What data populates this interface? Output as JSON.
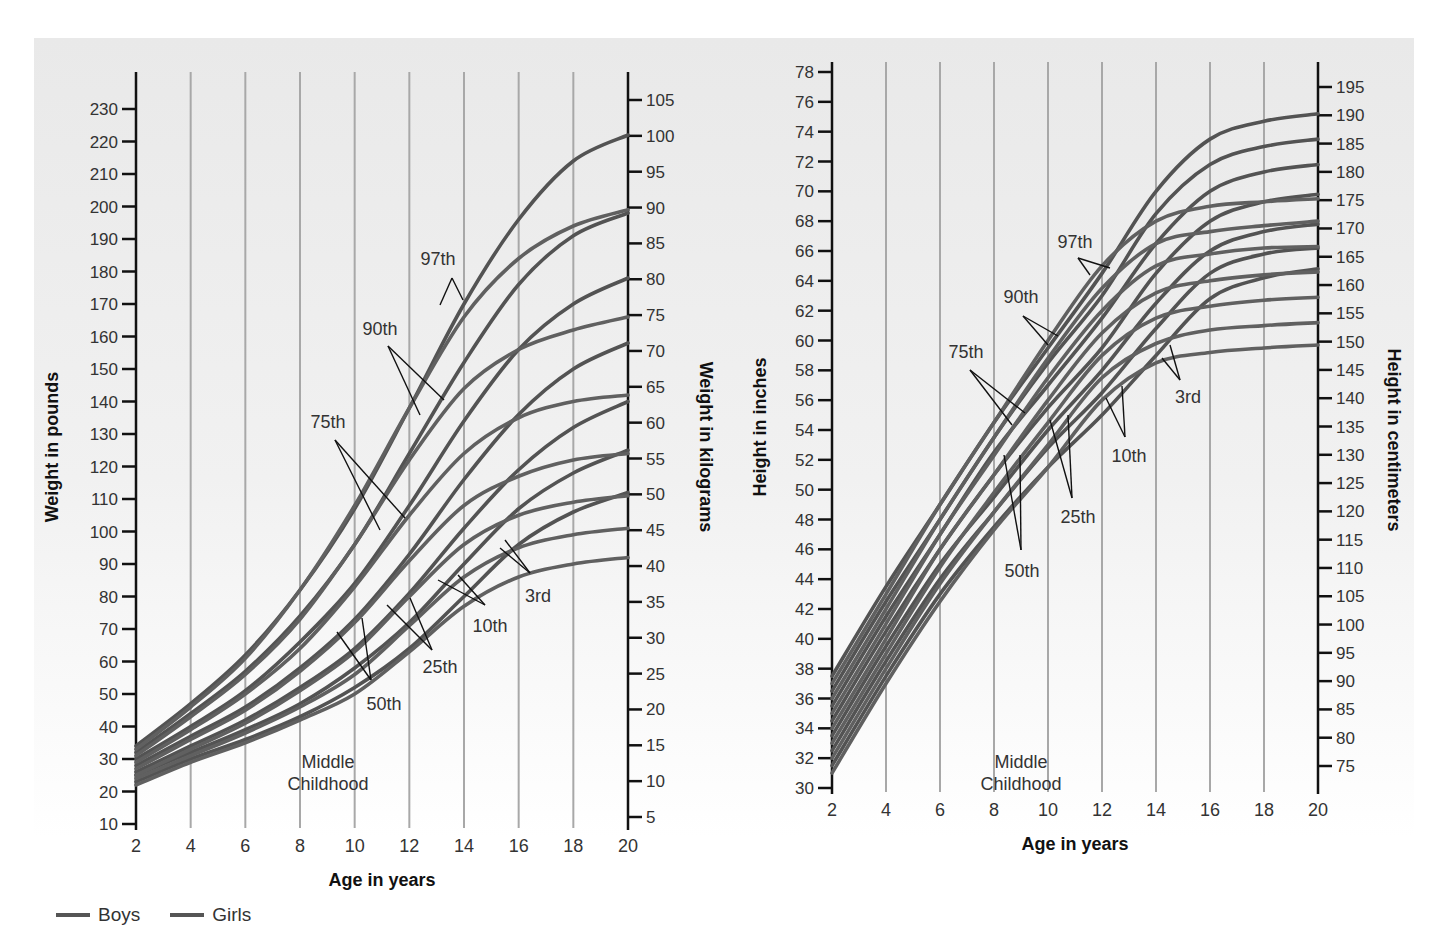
{
  "page": {
    "number_fragment": "391"
  },
  "legend": [
    {
      "label": "Boys",
      "color": "#5a5a5a"
    },
    {
      "label": "Girls",
      "color": "#6a6a6a"
    }
  ],
  "colors": {
    "panel_bg": "#ececec",
    "grid": "#a8a8a8",
    "axis": "#111111",
    "curve": "#555555",
    "text": "#333333"
  },
  "chart_data": [
    {
      "type": "line",
      "title": "Weight",
      "xlabel": "Age in years",
      "ylabel": "Weight in pounds",
      "ylabel_right": "Weight in kilograms",
      "x_ticks": [
        2,
        4,
        6,
        8,
        10,
        12,
        14,
        16,
        18,
        20
      ],
      "y_ticks": [
        10,
        20,
        30,
        40,
        50,
        60,
        70,
        80,
        90,
        100,
        110,
        120,
        130,
        140,
        150,
        160,
        170,
        180,
        190,
        200,
        210,
        220,
        230
      ],
      "y2_ticks": [
        5,
        10,
        15,
        20,
        25,
        30,
        35,
        40,
        45,
        50,
        55,
        60,
        65,
        70,
        75,
        80,
        85,
        90,
        95,
        100,
        105
      ],
      "xlim": [
        2,
        20
      ],
      "ylim": [
        10,
        230
      ],
      "y2lim": [
        5,
        105
      ],
      "annotation": "Middle Childhood",
      "percentile_labels": [
        "97th",
        "90th",
        "75th",
        "50th",
        "25th",
        "10th",
        "3rd"
      ],
      "x": [
        2,
        4,
        6,
        8,
        10,
        12,
        14,
        16,
        18,
        20
      ],
      "series": [
        {
          "name": "Boys 97th",
          "group": "Boys",
          "values": [
            34,
            47,
            62,
            82,
            107,
            138,
            170,
            196,
            214,
            222
          ]
        },
        {
          "name": "Boys 90th",
          "group": "Boys",
          "values": [
            32,
            44,
            57,
            74,
            96,
            124,
            152,
            176,
            191,
            198
          ]
        },
        {
          "name": "Boys 75th",
          "group": "Boys",
          "values": [
            30,
            40,
            51,
            66,
            84,
            108,
            134,
            156,
            170,
            178
          ]
        },
        {
          "name": "Boys 50th",
          "group": "Boys",
          "values": [
            28,
            37,
            46,
            58,
            73,
            93,
            116,
            136,
            150,
            158
          ]
        },
        {
          "name": "Boys 25th",
          "group": "Boys",
          "values": [
            26,
            34,
            42,
            52,
            64,
            81,
            101,
            119,
            132,
            140
          ]
        },
        {
          "name": "Boys 10th",
          "group": "Boys",
          "values": [
            25,
            32,
            39,
            47,
            58,
            72,
            90,
            107,
            118,
            125
          ]
        },
        {
          "name": "Boys 3rd",
          "group": "Boys",
          "values": [
            23,
            30,
            36,
            43,
            52,
            64,
            80,
            96,
            106,
            112
          ]
        },
        {
          "name": "Girls 97th",
          "group": "Girls",
          "values": [
            33,
            46,
            61,
            82,
            108,
            138,
            166,
            184,
            194,
            199
          ]
        },
        {
          "name": "Girls 90th",
          "group": "Girls",
          "values": [
            31,
            43,
            56,
            73,
            96,
            122,
            144,
            156,
            162,
            166
          ]
        },
        {
          "name": "Girls 75th",
          "group": "Girls",
          "values": [
            29,
            39,
            50,
            64,
            83,
            105,
            124,
            135,
            140,
            142
          ]
        },
        {
          "name": "Girls 50th",
          "group": "Girls",
          "values": [
            27,
            36,
            45,
            57,
            72,
            91,
            108,
            117,
            122,
            124
          ]
        },
        {
          "name": "Girls 25th",
          "group": "Girls",
          "values": [
            25,
            33,
            41,
            51,
            63,
            80,
            96,
            105,
            109,
            111
          ]
        },
        {
          "name": "Girls 10th",
          "group": "Girls",
          "values": [
            24,
            31,
            38,
            46,
            56,
            71,
            86,
            95,
            99,
            101
          ]
        },
        {
          "name": "Girls 3rd",
          "group": "Girls",
          "values": [
            22,
            29,
            35,
            42,
            50,
            63,
            77,
            86,
            90,
            92
          ]
        }
      ]
    },
    {
      "type": "line",
      "title": "Height",
      "xlabel": "Age in years",
      "ylabel": "Height in inches",
      "ylabel_right": "Height in centimeters",
      "x_ticks": [
        2,
        4,
        6,
        8,
        10,
        12,
        14,
        16,
        18,
        20
      ],
      "y_ticks": [
        30,
        32,
        34,
        36,
        38,
        40,
        42,
        44,
        46,
        48,
        50,
        52,
        54,
        56,
        58,
        60,
        62,
        64,
        66,
        68,
        70,
        72,
        74,
        76,
        78
      ],
      "y2_ticks": [
        75,
        80,
        85,
        90,
        95,
        100,
        105,
        110,
        115,
        120,
        125,
        130,
        135,
        140,
        145,
        150,
        155,
        160,
        165,
        170,
        175,
        180,
        185,
        190,
        195
      ],
      "xlim": [
        2,
        20
      ],
      "ylim": [
        30,
        78
      ],
      "y2lim": [
        75,
        195
      ],
      "annotation": "Middle Childhood",
      "percentile_labels": [
        "97th",
        "90th",
        "75th",
        "50th",
        "25th",
        "10th",
        "3rd"
      ],
      "x": [
        2,
        4,
        6,
        8,
        10,
        12,
        14,
        16,
        18,
        20
      ],
      "series": [
        {
          "name": "Boys 97th",
          "group": "Boys",
          "values": [
            37.5,
            43.5,
            49,
            54.5,
            59.5,
            64.5,
            70,
            73.5,
            74.7,
            75.2
          ]
        },
        {
          "name": "Boys 90th",
          "group": "Boys",
          "values": [
            36.5,
            42.5,
            48,
            53.5,
            58.5,
            63,
            68.5,
            71.8,
            73,
            73.5
          ]
        },
        {
          "name": "Boys 75th",
          "group": "Boys",
          "values": [
            35.5,
            41.5,
            47,
            52.5,
            57,
            61.5,
            66.5,
            70,
            71.3,
            71.8
          ]
        },
        {
          "name": "Boys 50th",
          "group": "Boys",
          "values": [
            34.5,
            40.5,
            46,
            51,
            55.5,
            59.5,
            64.5,
            68,
            69.3,
            69.8
          ]
        },
        {
          "name": "Boys 25th",
          "group": "Boys",
          "values": [
            33.5,
            39.5,
            45,
            49.5,
            54,
            58,
            62.5,
            66,
            67.3,
            67.8
          ]
        },
        {
          "name": "Boys 10th",
          "group": "Boys",
          "values": [
            32.5,
            38.5,
            44,
            48.5,
            52.8,
            56.5,
            60.8,
            64.5,
            65.8,
            66.2
          ]
        },
        {
          "name": "Boys 3rd",
          "group": "Boys",
          "values": [
            31.5,
            37.5,
            43,
            47.5,
            51.5,
            55,
            59,
            62.8,
            64.2,
            64.8
          ]
        },
        {
          "name": "Girls 97th",
          "group": "Girls",
          "values": [
            37,
            43,
            49,
            54.5,
            60,
            65,
            68,
            69,
            69.3,
            69.5
          ]
        },
        {
          "name": "Girls 90th",
          "group": "Girls",
          "values": [
            36,
            42,
            48,
            53.5,
            58.8,
            63.5,
            66.5,
            67.3,
            67.7,
            68
          ]
        },
        {
          "name": "Girls 75th",
          "group": "Girls",
          "values": [
            35,
            41,
            47,
            52.3,
            57.5,
            62,
            65,
            65.8,
            66.2,
            66.3
          ]
        },
        {
          "name": "Girls 50th",
          "group": "Girls",
          "values": [
            34,
            40,
            46,
            51,
            56,
            60.5,
            63.2,
            64,
            64.4,
            64.6
          ]
        },
        {
          "name": "Girls 25th",
          "group": "Girls",
          "values": [
            33,
            39,
            44.8,
            49.8,
            54.5,
            59,
            61.5,
            62.3,
            62.7,
            62.9
          ]
        },
        {
          "name": "Girls 10th",
          "group": "Girls",
          "values": [
            32,
            38,
            43.7,
            48.5,
            53,
            57.5,
            59.8,
            60.7,
            61,
            61.2
          ]
        },
        {
          "name": "Girls 3rd",
          "group": "Girls",
          "values": [
            31,
            37,
            42.5,
            47.3,
            51.5,
            56,
            58.5,
            59.2,
            59.5,
            59.7
          ]
        }
      ]
    }
  ]
}
